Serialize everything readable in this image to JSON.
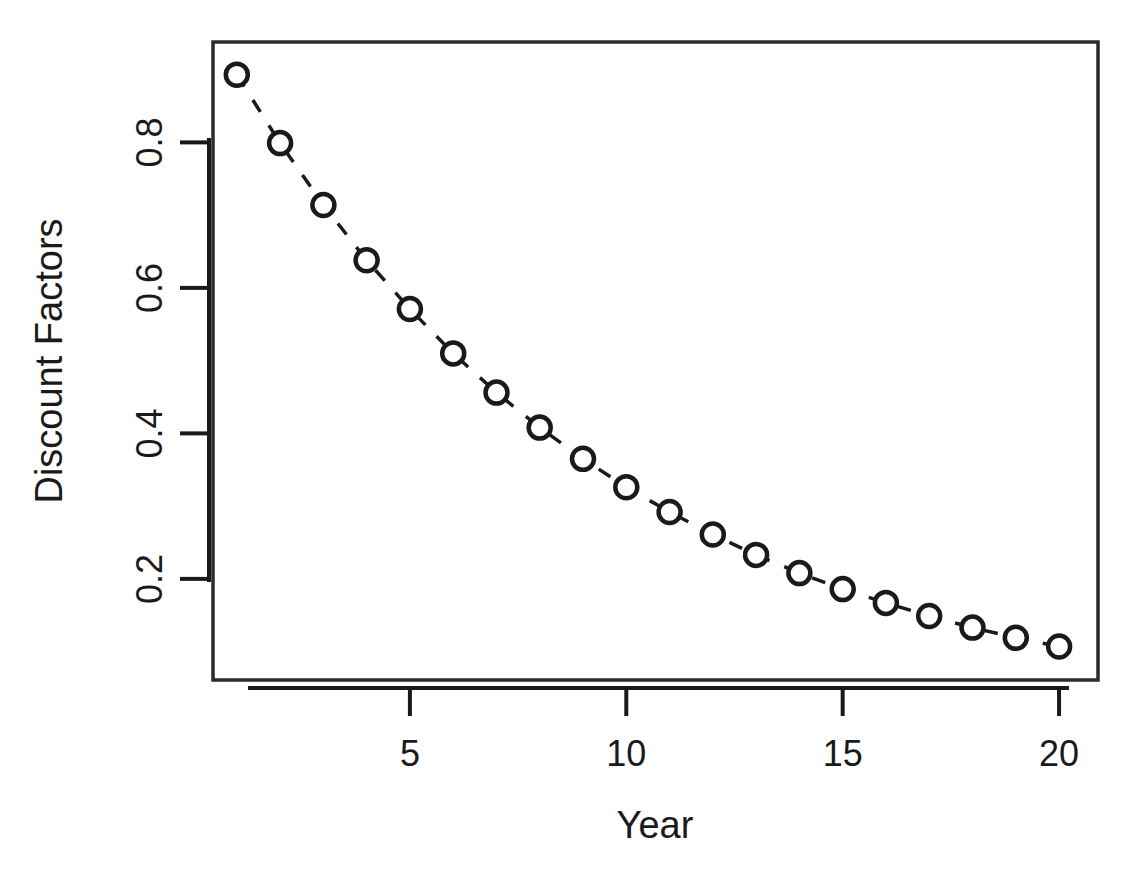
{
  "chart_data": {
    "type": "scatter",
    "title": "",
    "xlabel": "Year",
    "ylabel": "Discount Factors",
    "x": [
      1,
      2,
      3,
      4,
      5,
      6,
      7,
      8,
      9,
      10,
      11,
      12,
      13,
      14,
      15,
      16,
      17,
      18,
      19,
      20
    ],
    "values": [
      0.893,
      0.799,
      0.714,
      0.638,
      0.571,
      0.51,
      0.456,
      0.408,
      0.365,
      0.326,
      0.292,
      0.261,
      0.233,
      0.208,
      0.186,
      0.167,
      0.149,
      0.133,
      0.119,
      0.107
    ],
    "series": [
      {
        "name": "Discount Factors",
        "values": [
          0.893,
          0.799,
          0.714,
          0.638,
          0.571,
          0.51,
          0.456,
          0.408,
          0.365,
          0.326,
          0.292,
          0.261,
          0.233,
          0.208,
          0.186,
          0.167,
          0.149,
          0.133,
          0.119,
          0.107
        ]
      }
    ],
    "xlim": [
      0.45,
      20.9
    ],
    "ylim": [
      0.061,
      0.938
    ],
    "xticks": [
      5,
      10,
      15,
      20
    ],
    "xtick_labels": [
      "5",
      "10",
      "15",
      "20"
    ],
    "yticks": [
      0.2,
      0.4,
      0.6,
      0.8
    ],
    "ytick_labels": [
      "0.2",
      "0.4",
      "0.6",
      "0.8"
    ],
    "grid": false,
    "legend": false,
    "marker": "open-circle",
    "line_style": "dashed",
    "line_color": "#1a1a1a",
    "marker_color": "#1a1a1a",
    "frame": true,
    "background": "#ffffff"
  }
}
